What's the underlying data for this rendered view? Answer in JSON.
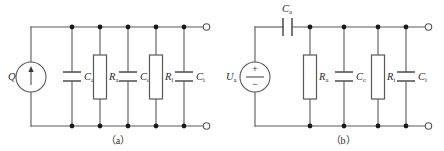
{
  "figure": {
    "background_color": "#ffffff",
    "line_color": "#58585a",
    "node_color": "#1a1a1a",
    "text_color": "#2b2b2d",
    "width": 444,
    "height": 151
  },
  "panels": [
    {
      "id": "a",
      "caption": "（a）",
      "source": {
        "type": "current-source",
        "symbol": "Q",
        "subscript": "",
        "marking": "arrow-up"
      },
      "components": [
        {
          "type": "capacitor",
          "symbol": "C",
          "subscript": "a",
          "label": "Ca"
        },
        {
          "type": "resistor",
          "symbol": "R",
          "subscript": "a",
          "label": "Ra"
        },
        {
          "type": "capacitor",
          "symbol": "C",
          "subscript": "c",
          "label": "Cc"
        },
        {
          "type": "resistor",
          "symbol": "R",
          "subscript": "i",
          "label": "Ri"
        },
        {
          "type": "capacitor",
          "symbol": "C",
          "subscript": "i",
          "label": "Ci"
        }
      ],
      "terminals": [
        {
          "name": "top-right-terminal",
          "state": "open"
        },
        {
          "name": "bottom-right-terminal",
          "state": "open"
        }
      ]
    },
    {
      "id": "b",
      "caption": "（b）",
      "source": {
        "type": "voltage-source",
        "symbol": "U",
        "subscript": "a",
        "label": "Ua",
        "plus_sign": "+",
        "minus_sign": "−"
      },
      "series_component": {
        "type": "capacitor",
        "symbol": "C",
        "subscript": "a",
        "label": "Ca",
        "orientation": "vertical-plates"
      },
      "components": [
        {
          "type": "resistor",
          "symbol": "R",
          "subscript": "a",
          "label": "Ra"
        },
        {
          "type": "capacitor",
          "symbol": "C",
          "subscript": "c",
          "label": "Cc"
        },
        {
          "type": "resistor",
          "symbol": "R",
          "subscript": "i",
          "label": "Ri"
        },
        {
          "type": "capacitor",
          "symbol": "C",
          "subscript": "i",
          "label": "Ci"
        }
      ],
      "terminals": [
        {
          "name": "top-right-terminal",
          "state": "open"
        },
        {
          "name": "bottom-right-terminal",
          "state": "open"
        }
      ]
    }
  ]
}
